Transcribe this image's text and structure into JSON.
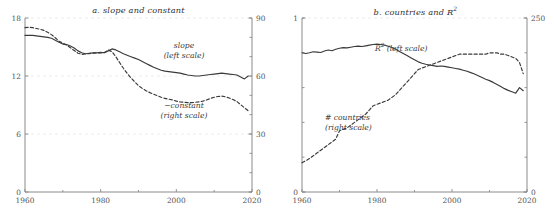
{
  "figure": {
    "background": "#ffffff",
    "axis_color": "#8a8a8a",
    "grid_color": "#ece4e4",
    "series_color": "#3a3a3a"
  },
  "chart_data": [
    {
      "type": "line",
      "panel": "a",
      "title": "a. slope and constant",
      "title_prefix": "a. slope and constant",
      "xlabel": "",
      "xlim": [
        1960,
        2020
      ],
      "xticks": [
        1960,
        1980,
        2000,
        2020
      ],
      "xtick_labels": [
        "1960",
        "1980",
        "2000",
        "2020"
      ],
      "xminor_step": 10,
      "ylabel_left": "",
      "ylim_left": [
        0,
        18
      ],
      "yticks_left": [
        0,
        6,
        12,
        18
      ],
      "ytick_labels_left": [
        "0",
        "6",
        "12",
        "18"
      ],
      "ylabel_right": "",
      "ylim_right": [
        0,
        90
      ],
      "yticks_right": [
        0,
        30,
        60,
        90
      ],
      "ytick_labels_right": [
        "0",
        "30",
        "60",
        "90"
      ],
      "yminor_step_right": 10,
      "grid": "horizontal-dashed",
      "legend": "inline-annotations",
      "series": [
        {
          "name": "slope",
          "label_line1": "slope",
          "label_line2": "(left scale)",
          "scale": "left",
          "style": "solid",
          "x": [
            1960,
            1961,
            1962,
            1963,
            1964,
            1965,
            1966,
            1967,
            1968,
            1969,
            1970,
            1971,
            1972,
            1973,
            1974,
            1975,
            1976,
            1977,
            1978,
            1979,
            1980,
            1981,
            1982,
            1983,
            1984,
            1985,
            1986,
            1987,
            1988,
            1989,
            1990,
            1991,
            1992,
            1993,
            1994,
            1995,
            1996,
            1997,
            1998,
            1999,
            2000,
            2001,
            2002,
            2003,
            2004,
            2005,
            2006,
            2007,
            2008,
            2009,
            2010,
            2011,
            2012,
            2013,
            2014,
            2015,
            2016,
            2017,
            2018,
            2019
          ],
          "values": [
            16.2,
            16.2,
            16.2,
            16.15,
            16.1,
            16.05,
            16.0,
            15.9,
            15.7,
            15.5,
            15.3,
            15.25,
            15.1,
            14.9,
            14.6,
            14.4,
            14.3,
            14.35,
            14.4,
            14.4,
            14.45,
            14.4,
            14.6,
            14.8,
            14.7,
            14.5,
            14.3,
            14.15,
            14.0,
            13.85,
            13.7,
            13.5,
            13.3,
            13.1,
            12.9,
            12.75,
            12.6,
            12.5,
            12.45,
            12.4,
            12.35,
            12.3,
            12.2,
            12.1,
            12.05,
            12.0,
            12.0,
            12.05,
            12.1,
            12.15,
            12.2,
            12.25,
            12.3,
            12.25,
            12.2,
            12.15,
            12.1,
            11.9,
            11.7,
            12.0
          ]
        },
        {
          "name": "-constant",
          "label_line1": "−constant",
          "label_line2": "(right scale)",
          "scale": "right",
          "style": "dashed",
          "x": [
            1960,
            1961,
            1962,
            1963,
            1964,
            1965,
            1966,
            1967,
            1968,
            1969,
            1970,
            1971,
            1972,
            1973,
            1974,
            1975,
            1976,
            1977,
            1978,
            1979,
            1980,
            1981,
            1982,
            1983,
            1984,
            1985,
            1986,
            1987,
            1988,
            1989,
            1990,
            1991,
            1992,
            1993,
            1994,
            1995,
            1996,
            1997,
            1998,
            1999,
            2000,
            2001,
            2002,
            2003,
            2004,
            2005,
            2006,
            2007,
            2008,
            2009,
            2010,
            2011,
            2012,
            2013,
            2014,
            2015,
            2016,
            2017,
            2018,
            2019
          ],
          "values": [
            85.0,
            85.2,
            85.0,
            84.6,
            84.2,
            83.6,
            82.6,
            81.4,
            79.8,
            78.0,
            77.0,
            76.0,
            74.6,
            73.2,
            71.8,
            71.2,
            71.4,
            71.6,
            71.8,
            72.0,
            72.0,
            72.2,
            73.4,
            72.6,
            70.0,
            67.0,
            64.0,
            61.4,
            59.0,
            57.0,
            55.0,
            53.6,
            52.4,
            51.4,
            50.6,
            49.8,
            49.0,
            48.4,
            48.0,
            47.6,
            47.0,
            46.6,
            46.4,
            46.2,
            46.2,
            46.4,
            46.6,
            47.0,
            47.6,
            48.4,
            49.0,
            49.4,
            49.6,
            49.2,
            48.6,
            47.8,
            46.8,
            45.2,
            43.6,
            42.0
          ]
        }
      ]
    },
    {
      "type": "line",
      "panel": "b",
      "title": "b. countries and R2",
      "title_main": "b. countries and R",
      "title_sup": "2",
      "xlabel": "",
      "xlim": [
        1960,
        2020
      ],
      "xticks": [
        1960,
        1980,
        2000,
        2020
      ],
      "xtick_labels": [
        "1960",
        "1980",
        "2000",
        "2020"
      ],
      "xminor_step": 10,
      "ylim_left": [
        0,
        1
      ],
      "yticks_left": [
        0,
        1
      ],
      "ytick_labels_left": [
        "0",
        "1"
      ],
      "yminor_step_left": 0.2,
      "ylim_right": [
        0,
        250
      ],
      "yticks_right": [
        0,
        250
      ],
      "ytick_labels_right": [
        "0",
        "250"
      ],
      "yminor_step_right": 50,
      "grid": "horizontal-dashed",
      "legend": "inline-annotations",
      "series": [
        {
          "name": "R2",
          "label_main": "R",
          "label_sup": "2",
          "label_suffix": " (left scale)",
          "scale": "left",
          "style": "solid",
          "x": [
            1960,
            1961,
            1962,
            1963,
            1964,
            1965,
            1966,
            1967,
            1968,
            1969,
            1970,
            1971,
            1972,
            1973,
            1974,
            1975,
            1976,
            1977,
            1978,
            1979,
            1980,
            1981,
            1982,
            1983,
            1984,
            1985,
            1986,
            1987,
            1988,
            1989,
            1990,
            1991,
            1992,
            1993,
            1994,
            1995,
            1996,
            1997,
            1998,
            1999,
            2000,
            2001,
            2002,
            2003,
            2004,
            2005,
            2006,
            2007,
            2008,
            2009,
            2010,
            2011,
            2012,
            2013,
            2014,
            2015,
            2016,
            2017,
            2018,
            2019
          ],
          "values": [
            0.8,
            0.796,
            0.8,
            0.806,
            0.804,
            0.802,
            0.81,
            0.816,
            0.812,
            0.82,
            0.826,
            0.83,
            0.828,
            0.832,
            0.836,
            0.838,
            0.836,
            0.84,
            0.844,
            0.848,
            0.85,
            0.848,
            0.844,
            0.838,
            0.83,
            0.82,
            0.808,
            0.796,
            0.784,
            0.772,
            0.76,
            0.748,
            0.74,
            0.734,
            0.73,
            0.726,
            0.722,
            0.724,
            0.722,
            0.718,
            0.714,
            0.71,
            0.706,
            0.7,
            0.694,
            0.686,
            0.678,
            0.668,
            0.658,
            0.648,
            0.64,
            0.63,
            0.618,
            0.606,
            0.594,
            0.584,
            0.576,
            0.568,
            0.6,
            0.582
          ]
        },
        {
          "name": "# countries",
          "label_line1": "# countries",
          "label_line2": "(right scale)",
          "scale": "right",
          "style": "dashed",
          "x": [
            1960,
            1961,
            1962,
            1963,
            1964,
            1965,
            1966,
            1967,
            1968,
            1969,
            1970,
            1971,
            1972,
            1973,
            1974,
            1975,
            1976,
            1977,
            1978,
            1979,
            1980,
            1981,
            1982,
            1983,
            1984,
            1985,
            1986,
            1987,
            1988,
            1989,
            1990,
            1991,
            1992,
            1993,
            1994,
            1995,
            1996,
            1997,
            1998,
            1999,
            2000,
            2001,
            2002,
            2003,
            2004,
            2005,
            2006,
            2007,
            2008,
            2009,
            2010,
            2011,
            2012,
            2013,
            2014,
            2015,
            2016,
            2017,
            2018,
            2019
          ],
          "values": [
            42,
            45,
            48,
            52,
            56,
            60,
            64,
            68,
            72,
            76,
            88,
            90,
            92,
            96,
            100,
            104,
            108,
            112,
            118,
            124,
            126,
            128,
            130,
            132,
            136,
            140,
            146,
            152,
            158,
            164,
            170,
            176,
            178,
            180,
            182,
            184,
            186,
            188,
            190,
            192,
            194,
            196,
            198,
            198,
            198,
            198,
            198,
            198,
            198,
            198,
            200,
            200,
            200,
            198,
            198,
            196,
            194,
            192,
            186,
            170
          ]
        }
      ]
    }
  ]
}
